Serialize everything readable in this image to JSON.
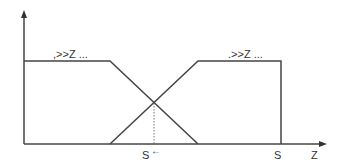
{
  "diagram": {
    "type": "membership-functions",
    "axis": {
      "x_label": "Z"
    },
    "labels": {
      "left_set": ",>>Z ...",
      "right_set": ".>>Z ...",
      "crossover_tick": "S",
      "crossover_arrow": "←",
      "right_tick": "S"
    },
    "colors": {
      "line": "#444444",
      "dotted": "#777777",
      "text": "#333333"
    }
  }
}
